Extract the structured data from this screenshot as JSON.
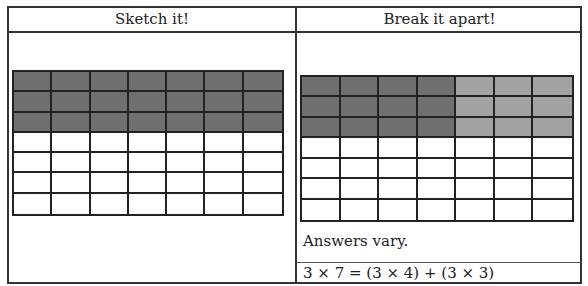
{
  "table": {
    "columns": [
      {
        "header": "Sketch it!"
      },
      {
        "header": "Break it apart!"
      }
    ]
  },
  "sketch_grid": {
    "rows": 7,
    "cols": 7,
    "shaded_rows": 3,
    "shade_groups": [
      {
        "cols": 7,
        "color": "#6f6f6f"
      }
    ]
  },
  "break_grid": {
    "rows": 7,
    "cols": 7,
    "shaded_rows": 3,
    "shade_groups": [
      {
        "cols": 4,
        "color": "#6f6f6f"
      },
      {
        "cols": 3,
        "color": "#a2a2a2"
      }
    ]
  },
  "answer": {
    "note": "Answers vary.",
    "equation": "3 × 7 = (3 × 4) + (3 × 3)"
  }
}
